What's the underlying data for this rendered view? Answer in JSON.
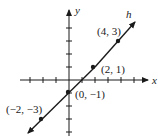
{
  "diagram": {
    "axes": {
      "x_label": "x",
      "y_label": "y"
    },
    "line_label": "h",
    "points": [
      {
        "label": "(4, 3)",
        "x": 4,
        "y": 3
      },
      {
        "label": "(2, 1)",
        "x": 2,
        "y": 1
      },
      {
        "label": "(0, −1)",
        "x": 0,
        "y": -1
      },
      {
        "label": "(−2, −3)",
        "x": -2,
        "y": -3
      }
    ]
  }
}
